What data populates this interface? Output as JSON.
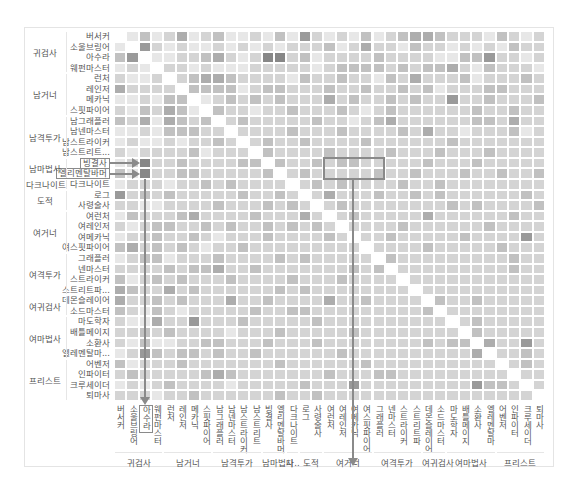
{
  "chart_data": {
    "type": "heatmap",
    "title": "",
    "colorscale": [
      "#ffffff",
      "#8c8c8c"
    ],
    "row_labels": [
      "버서커",
      "소울브링어",
      "아수라",
      "웨펀마스터",
      "런처",
      "레인저",
      "메카닉",
      "스핏파이어",
      "남그래플러",
      "남넨마스터",
      "남스트라이커",
      "남스트리트...",
      "빙결사",
      "엘리멘탈바머",
      "다크나이트",
      "로그",
      "사령술사",
      "여런처",
      "여레인저",
      "여메카닉",
      "여스핏파이어",
      "그래플러",
      "넨마스터",
      "스트라이커",
      "스트리트파...",
      "데몬슬레이어",
      "소드마스터",
      "마도학자",
      "배틀메이지",
      "소환사",
      "엘레멘탈마...",
      "어벤저",
      "인파이터",
      "크루세이더",
      "퇴마사"
    ],
    "col_labels": [
      "버서커",
      "소울브링어",
      "아수라",
      "웨펀마스터",
      "런처",
      "레인저",
      "메카닉",
      "스핏파이어",
      "남그래플러",
      "남넨마스터",
      "남스트라이커",
      "남스트리트",
      "빙결사",
      "엘리멘탈바머",
      "다크나이트",
      "로그",
      "사령술사",
      "여런처",
      "여레인저",
      "여메카닉",
      "여스핏파이어",
      "그래플러",
      "넨마스터",
      "스트라이커",
      "스트리트파",
      "데몬슬레이어",
      "소드마스터",
      "마도학자",
      "배틀메이지",
      "소환사",
      "엘레멘탈마",
      "어벤저",
      "인파이터",
      "크루세이더",
      "퇴마사"
    ],
    "row_groups": [
      {
        "label": "귀검사",
        "start": 0,
        "count": 4
      },
      {
        "label": "남거너",
        "start": 4,
        "count": 4
      },
      {
        "label": "남격투가",
        "start": 8,
        "count": 4
      },
      {
        "label": "남마법사",
        "start": 12,
        "count": 2
      },
      {
        "label": "다크나이트",
        "start": 14,
        "count": 1
      },
      {
        "label": "도적",
        "start": 15,
        "count": 2
      },
      {
        "label": "여거너",
        "start": 17,
        "count": 4
      },
      {
        "label": "여격투가",
        "start": 21,
        "count": 4
      },
      {
        "label": "여귀검사",
        "start": 25,
        "count": 2
      },
      {
        "label": "여마법사",
        "start": 27,
        "count": 4
      },
      {
        "label": "프리스트",
        "start": 31,
        "count": 4
      }
    ],
    "col_groups": [
      {
        "label": "귀검사",
        "start": 0,
        "count": 4
      },
      {
        "label": "남거너",
        "start": 4,
        "count": 4
      },
      {
        "label": "남격투가",
        "start": 8,
        "count": 4
      },
      {
        "label": "남마법사",
        "start": 12,
        "count": 2
      },
      {
        "label": "다..",
        "start": 14,
        "count": 1
      },
      {
        "label": "도적",
        "start": 15,
        "count": 2
      },
      {
        "label": "여거너",
        "start": 17,
        "count": 4
      },
      {
        "label": "여격투가",
        "start": 21,
        "count": 4
      },
      {
        "label": "여귀검사",
        "start": 25,
        "count": 2
      },
      {
        "label": "여마법사",
        "start": 27,
        "count": 4
      },
      {
        "label": "프리스트",
        "start": 31,
        "count": 4
      }
    ],
    "highlighted_rows": [
      "빙결사",
      "엘리멘탈바머"
    ],
    "highlighted_col": "아수라",
    "highlighted_box": {
      "rows": [
        12,
        13
      ],
      "cols": [
        17,
        21
      ],
      "arrow_to_col": "여메카닉"
    },
    "values": [
      [
        0,
        1,
        3,
        1,
        2,
        4,
        1,
        2,
        3,
        1,
        1,
        2,
        1,
        3,
        1,
        5,
        2,
        1,
        2,
        1,
        3,
        1,
        2,
        3,
        4,
        4,
        3,
        2,
        2,
        2,
        1,
        3,
        2,
        1,
        2
      ],
      [
        1,
        0,
        5,
        2,
        1,
        2,
        1,
        1,
        2,
        1,
        2,
        1,
        2,
        1,
        2,
        2,
        2,
        3,
        1,
        2,
        4,
        2,
        2,
        1,
        3,
        2,
        2,
        1,
        2,
        1,
        2,
        1,
        3,
        2,
        2
      ],
      [
        3,
        5,
        0,
        1,
        1,
        2,
        2,
        3,
        4,
        2,
        1,
        2,
        6,
        6,
        2,
        3,
        1,
        2,
        2,
        2,
        2,
        3,
        2,
        2,
        2,
        2,
        1,
        1,
        3,
        3,
        5,
        2,
        2,
        1,
        2
      ],
      [
        1,
        2,
        1,
        0,
        2,
        2,
        1,
        2,
        1,
        1,
        1,
        2,
        2,
        2,
        2,
        2,
        1,
        2,
        3,
        3,
        3,
        3,
        2,
        3,
        2,
        3,
        3,
        4,
        2,
        1,
        3,
        2,
        2,
        2,
        1
      ],
      [
        2,
        1,
        1,
        2,
        0,
        2,
        3,
        4,
        4,
        3,
        2,
        2,
        2,
        2,
        1,
        3,
        2,
        2,
        3,
        2,
        2,
        1,
        3,
        2,
        4,
        2,
        2,
        2,
        3,
        1,
        2,
        2,
        2,
        3,
        2
      ],
      [
        4,
        2,
        2,
        2,
        2,
        0,
        3,
        3,
        3,
        3,
        1,
        2,
        3,
        3,
        2,
        2,
        2,
        3,
        2,
        2,
        3,
        2,
        2,
        3,
        2,
        3,
        1,
        2,
        2,
        2,
        3,
        3,
        2,
        2,
        2
      ],
      [
        1,
        1,
        2,
        1,
        3,
        3,
        0,
        1,
        2,
        3,
        2,
        3,
        2,
        3,
        2,
        2,
        2,
        4,
        2,
        3,
        2,
        2,
        3,
        2,
        3,
        2,
        2,
        5,
        2,
        2,
        3,
        2,
        2,
        2,
        3
      ],
      [
        2,
        1,
        3,
        2,
        4,
        3,
        1,
        0,
        3,
        2,
        2,
        1,
        2,
        2,
        3,
        2,
        2,
        2,
        3,
        2,
        1,
        2,
        3,
        2,
        2,
        2,
        2,
        2,
        2,
        3,
        2,
        2,
        3,
        2,
        2
      ],
      [
        3,
        2,
        4,
        1,
        4,
        3,
        2,
        3,
        0,
        2,
        3,
        2,
        2,
        2,
        2,
        2,
        3,
        2,
        2,
        1,
        2,
        3,
        4,
        2,
        2,
        2,
        2,
        2,
        2,
        3,
        3,
        2,
        4,
        2,
        2
      ],
      [
        1,
        1,
        2,
        1,
        3,
        3,
        3,
        2,
        2,
        0,
        2,
        2,
        2,
        2,
        3,
        2,
        2,
        2,
        3,
        2,
        2,
        2,
        2,
        3,
        2,
        4,
        2,
        2,
        1,
        2,
        2,
        2,
        3,
        1,
        2
      ],
      [
        1,
        2,
        1,
        1,
        2,
        1,
        2,
        2,
        3,
        2,
        0,
        2,
        3,
        2,
        2,
        3,
        2,
        2,
        2,
        2,
        3,
        2,
        2,
        2,
        2,
        2,
        2,
        3,
        2,
        2,
        2,
        2,
        2,
        2,
        2
      ],
      [
        2,
        1,
        2,
        2,
        2,
        2,
        3,
        1,
        2,
        2,
        2,
        0,
        3,
        2,
        2,
        2,
        2,
        3,
        2,
        2,
        2,
        2,
        3,
        2,
        2,
        2,
        3,
        2,
        2,
        2,
        3,
        2,
        2,
        2,
        2
      ],
      [
        1,
        2,
        6,
        2,
        2,
        3,
        2,
        2,
        2,
        2,
        3,
        3,
        0,
        3,
        2,
        2,
        3,
        2,
        3,
        3,
        2,
        2,
        2,
        2,
        2,
        3,
        2,
        2,
        2,
        3,
        2,
        2,
        2,
        2,
        2
      ],
      [
        3,
        1,
        6,
        2,
        2,
        3,
        3,
        2,
        2,
        2,
        2,
        2,
        3,
        0,
        2,
        3,
        2,
        2,
        2,
        2,
        2,
        3,
        2,
        2,
        3,
        2,
        2,
        2,
        3,
        2,
        2,
        3,
        2,
        2,
        3
      ],
      [
        1,
        2,
        2,
        2,
        1,
        2,
        2,
        3,
        2,
        3,
        2,
        2,
        2,
        2,
        0,
        2,
        3,
        2,
        3,
        2,
        2,
        2,
        2,
        3,
        2,
        2,
        3,
        2,
        2,
        2,
        2,
        2,
        2,
        2,
        2
      ],
      [
        5,
        2,
        3,
        2,
        3,
        2,
        2,
        2,
        2,
        2,
        3,
        2,
        2,
        3,
        2,
        0,
        2,
        4,
        2,
        2,
        2,
        3,
        2,
        2,
        3,
        2,
        3,
        2,
        2,
        2,
        2,
        2,
        2,
        3,
        2
      ],
      [
        2,
        2,
        1,
        1,
        2,
        2,
        2,
        2,
        3,
        2,
        2,
        2,
        3,
        2,
        3,
        2,
        0,
        2,
        3,
        2,
        2,
        2,
        2,
        2,
        2,
        2,
        2,
        3,
        2,
        3,
        2,
        2,
        2,
        2,
        3
      ],
      [
        1,
        3,
        2,
        2,
        2,
        3,
        4,
        2,
        2,
        2,
        2,
        3,
        2,
        2,
        2,
        4,
        2,
        0,
        2,
        3,
        2,
        2,
        2,
        2,
        2,
        4,
        2,
        2,
        2,
        2,
        2,
        2,
        3,
        2,
        2
      ],
      [
        2,
        1,
        2,
        3,
        3,
        2,
        2,
        3,
        2,
        3,
        2,
        2,
        3,
        2,
        3,
        2,
        3,
        2,
        0,
        2,
        2,
        2,
        2,
        3,
        2,
        2,
        2,
        2,
        2,
        2,
        3,
        2,
        2,
        2,
        2
      ],
      [
        1,
        2,
        2,
        3,
        2,
        2,
        3,
        2,
        1,
        2,
        2,
        2,
        3,
        2,
        2,
        2,
        2,
        3,
        2,
        0,
        2,
        2,
        3,
        2,
        2,
        2,
        2,
        2,
        3,
        2,
        2,
        2,
        2,
        5,
        2
      ],
      [
        3,
        4,
        2,
        3,
        2,
        3,
        2,
        1,
        2,
        2,
        3,
        2,
        2,
        2,
        2,
        2,
        2,
        2,
        2,
        2,
        0,
        2,
        2,
        2,
        2,
        3,
        2,
        2,
        2,
        2,
        2,
        3,
        2,
        2,
        2
      ],
      [
        1,
        2,
        3,
        3,
        1,
        2,
        2,
        2,
        3,
        2,
        2,
        2,
        2,
        3,
        2,
        3,
        2,
        2,
        2,
        2,
        2,
        0,
        3,
        2,
        2,
        2,
        2,
        2,
        2,
        2,
        2,
        2,
        3,
        2,
        2
      ],
      [
        2,
        2,
        2,
        2,
        3,
        2,
        3,
        3,
        4,
        2,
        2,
        3,
        2,
        2,
        2,
        2,
        2,
        2,
        2,
        3,
        2,
        3,
        0,
        2,
        2,
        2,
        2,
        2,
        2,
        2,
        2,
        2,
        3,
        2,
        2
      ],
      [
        3,
        1,
        2,
        3,
        2,
        3,
        2,
        2,
        2,
        3,
        2,
        2,
        2,
        2,
        3,
        2,
        2,
        2,
        3,
        2,
        2,
        2,
        2,
        0,
        2,
        2,
        2,
        2,
        2,
        2,
        2,
        2,
        2,
        2,
        2
      ],
      [
        4,
        3,
        2,
        2,
        4,
        2,
        3,
        2,
        2,
        2,
        2,
        2,
        2,
        3,
        2,
        3,
        2,
        2,
        2,
        2,
        2,
        2,
        2,
        2,
        0,
        2,
        2,
        2,
        2,
        2,
        2,
        2,
        2,
        2,
        2
      ],
      [
        4,
        2,
        2,
        3,
        2,
        3,
        2,
        2,
        2,
        4,
        2,
        2,
        3,
        2,
        2,
        2,
        2,
        4,
        2,
        2,
        3,
        2,
        2,
        2,
        2,
        0,
        3,
        2,
        2,
        3,
        2,
        2,
        2,
        2,
        2
      ],
      [
        3,
        2,
        1,
        3,
        2,
        1,
        2,
        2,
        2,
        2,
        2,
        3,
        2,
        2,
        3,
        3,
        2,
        2,
        2,
        2,
        2,
        2,
        2,
        2,
        2,
        3,
        0,
        2,
        2,
        2,
        2,
        2,
        2,
        2,
        2
      ],
      [
        2,
        1,
        1,
        4,
        2,
        2,
        5,
        2,
        2,
        2,
        3,
        2,
        2,
        2,
        2,
        2,
        3,
        2,
        2,
        2,
        2,
        2,
        2,
        2,
        2,
        2,
        2,
        0,
        2,
        3,
        2,
        2,
        2,
        2,
        2
      ],
      [
        2,
        2,
        3,
        2,
        3,
        2,
        2,
        2,
        2,
        1,
        2,
        2,
        2,
        3,
        2,
        2,
        2,
        2,
        2,
        3,
        2,
        2,
        2,
        2,
        2,
        2,
        2,
        2,
        0,
        3,
        2,
        2,
        2,
        2,
        2
      ],
      [
        2,
        1,
        3,
        1,
        1,
        2,
        2,
        3,
        3,
        2,
        2,
        2,
        3,
        2,
        2,
        2,
        3,
        2,
        2,
        2,
        2,
        2,
        2,
        2,
        2,
        3,
        2,
        3,
        3,
        0,
        4,
        2,
        2,
        5,
        2
      ],
      [
        1,
        2,
        5,
        3,
        2,
        3,
        3,
        2,
        3,
        2,
        2,
        3,
        2,
        2,
        2,
        2,
        2,
        2,
        3,
        2,
        2,
        2,
        2,
        2,
        2,
        2,
        2,
        2,
        2,
        4,
        0,
        2,
        2,
        3,
        2
      ],
      [
        3,
        1,
        2,
        2,
        2,
        3,
        2,
        2,
        2,
        2,
        2,
        2,
        2,
        3,
        2,
        2,
        2,
        2,
        2,
        2,
        3,
        2,
        2,
        2,
        2,
        2,
        2,
        2,
        2,
        2,
        2,
        0,
        2,
        3,
        2
      ],
      [
        2,
        3,
        2,
        2,
        2,
        2,
        2,
        3,
        4,
        3,
        2,
        2,
        2,
        2,
        2,
        2,
        2,
        3,
        2,
        2,
        2,
        3,
        3,
        2,
        2,
        2,
        2,
        2,
        2,
        2,
        2,
        2,
        0,
        2,
        2
      ],
      [
        1,
        2,
        1,
        2,
        3,
        2,
        2,
        2,
        2,
        1,
        2,
        2,
        2,
        2,
        2,
        3,
        2,
        2,
        2,
        5,
        2,
        2,
        2,
        2,
        2,
        2,
        2,
        2,
        2,
        5,
        3,
        3,
        2,
        0,
        2
      ],
      [
        2,
        2,
        2,
        1,
        2,
        2,
        3,
        2,
        2,
        2,
        2,
        2,
        2,
        3,
        2,
        2,
        3,
        2,
        2,
        2,
        2,
        2,
        2,
        2,
        2,
        2,
        2,
        2,
        2,
        2,
        2,
        2,
        2,
        2,
        0
      ]
    ],
    "value_scale": [
      0,
      6
    ],
    "legend": "none",
    "grid": false
  }
}
